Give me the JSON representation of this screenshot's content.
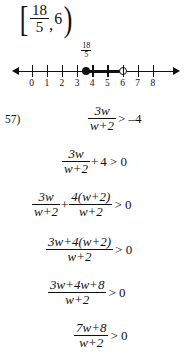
{
  "interval_answer": {
    "open_bracket": "[",
    "close_bracket": ")",
    "lower_numerator": "18",
    "lower_denominator": "5",
    "comma": ",",
    "upper_endpoint": "6"
  },
  "number_line": {
    "tick_labels": [
      "0",
      "1",
      "2",
      "3",
      "4",
      "5",
      "6",
      "7",
      "8"
    ],
    "point_label": {
      "numerator": "18",
      "denominator": "5"
    },
    "closed_endpoint_value": 3.6,
    "open_endpoint_value": 6,
    "axis_min": -0.9,
    "axis_max": 9.4,
    "left_arrow": "left-arrow",
    "right_arrow": "right-arrow"
  },
  "problem": {
    "number": "57)",
    "steps": [
      {
        "id": "step-1",
        "numerator": "3w",
        "denominator": "w+2",
        "relation": "> –4"
      },
      {
        "id": "step-2",
        "numerator": "3w",
        "denominator": "w+2",
        "plus": "+",
        "addend": "4",
        "relation": "> 0"
      },
      {
        "id": "step-3",
        "numerator_a": "3w",
        "denominator_a": "w+2",
        "plus": "+",
        "numerator_b": "4(w+2)",
        "denominator_b": "w+2",
        "relation": "> 0"
      },
      {
        "id": "step-4",
        "numerator": "3w+4(w+2)",
        "denominator": "w+2",
        "relation": "> 0"
      },
      {
        "id": "step-5",
        "numerator": "3w+4w+8",
        "denominator": "w+2",
        "relation": "> 0"
      },
      {
        "id": "step-6",
        "numerator": "7w+8",
        "denominator": "w+2",
        "relation": "> 0"
      }
    ]
  },
  "colors": {
    "ink": "#111111",
    "paper": "#ffffff"
  }
}
